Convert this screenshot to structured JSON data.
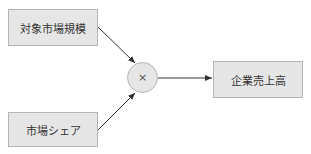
{
  "nodes": {
    "target_market_size": "対象市場規模",
    "market_share": "市場シェア",
    "operator": "×",
    "company_revenue": "企業売上高"
  }
}
